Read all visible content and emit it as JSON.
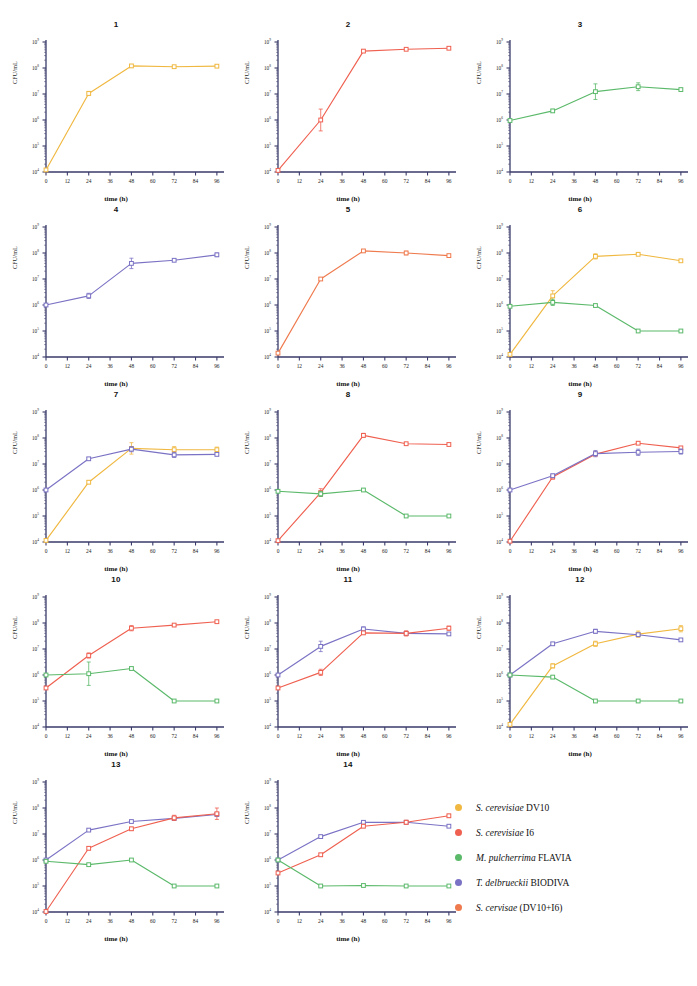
{
  "figure": {
    "axis": {
      "xlabel": "time (h)",
      "ylabel": "CFU/mL",
      "xticks": [
        0,
        12,
        24,
        36,
        48,
        60,
        72,
        84,
        96
      ],
      "ylog_exponents": [
        4,
        5,
        6,
        7,
        8,
        9
      ],
      "ytick_base": "10",
      "xlim": [
        0,
        100
      ],
      "ylim_exp": [
        4,
        9
      ],
      "grid": false
    },
    "caption": "",
    "legend": {
      "position": "bottom-right",
      "entries": [
        {
          "label_italic": "S. cerevisiae",
          "label_plain": "DV10",
          "color": "#f0b840",
          "key": "DV10"
        },
        {
          "label_italic": "S. cerevisiae",
          "label_plain": "I6",
          "color": "#ef6050",
          "key": "I6"
        },
        {
          "label_italic": "M. pulcherrima",
          "label_plain": "FLAVIA",
          "color": "#5bb96a",
          "key": "FLAVIA"
        },
        {
          "label_italic": "T. delbrueckii",
          "label_plain": "BIODIVA",
          "color": "#7a72c4",
          "key": "BIODIVA"
        },
        {
          "label_italic": "S. cervisae",
          "label_plain": "(DV10+I6)",
          "color": "#ef7a4e",
          "key": "DV10_I6"
        }
      ]
    }
  },
  "chart_data": [
    {
      "type": "line",
      "title": "1",
      "xlabel": "time (h)",
      "ylabel": "CFU/mL",
      "x": [
        0,
        24,
        48,
        72,
        96
      ],
      "xlim": [
        0,
        100
      ],
      "ylim": [
        4,
        9
      ],
      "yscale": "log10",
      "series": [
        {
          "name": "S. cerevisiae DV10",
          "color": "#f0b840",
          "log_values": [
            4.08,
            7.02,
            8.08,
            8.05,
            8.07
          ],
          "err_log": [
            0.05,
            0.08,
            0.05,
            0.02,
            0.02
          ]
        }
      ]
    },
    {
      "type": "line",
      "title": "2",
      "xlabel": "time (h)",
      "ylabel": "CFU/mL",
      "x": [
        0,
        24,
        48,
        72,
        96
      ],
      "xlim": [
        0,
        100
      ],
      "ylim": [
        4,
        9
      ],
      "yscale": "log10",
      "series": [
        {
          "name": "S. cerevisiae I6",
          "color": "#ef6050",
          "log_values": [
            4.06,
            6.0,
            8.65,
            8.72,
            8.76
          ],
          "err_log": [
            0.04,
            0.42,
            0.05,
            0.03,
            0.03
          ]
        }
      ]
    },
    {
      "type": "line",
      "title": "3",
      "xlabel": "time (h)",
      "ylabel": "CFU/mL",
      "x": [
        0,
        24,
        48,
        72,
        96
      ],
      "xlim": [
        0,
        100
      ],
      "ylim": [
        4,
        9
      ],
      "yscale": "log10",
      "series": [
        {
          "name": "M. pulcherrima FLAVIA",
          "color": "#5bb96a",
          "log_values": [
            5.98,
            6.35,
            7.09,
            7.28,
            7.17
          ],
          "err_log": [
            0.04,
            0.06,
            0.3,
            0.15,
            0.05
          ]
        }
      ]
    },
    {
      "type": "line",
      "title": "4",
      "xlabel": "time (h)",
      "ylabel": "CFU/mL",
      "x": [
        0,
        24,
        48,
        72,
        96
      ],
      "xlim": [
        0,
        100
      ],
      "ylim": [
        4,
        9
      ],
      "yscale": "log10",
      "series": [
        {
          "name": "T. delbrueckii BIODIVA",
          "color": "#7a72c4",
          "log_values": [
            6.0,
            6.35,
            7.6,
            7.72,
            7.93
          ],
          "err_log": [
            0.03,
            0.1,
            0.2,
            0.04,
            0.07
          ]
        }
      ]
    },
    {
      "type": "line",
      "title": "5",
      "xlabel": "time (h)",
      "ylabel": "CFU/mL",
      "x": [
        0,
        24,
        48,
        72,
        96
      ],
      "xlim": [
        0,
        100
      ],
      "ylim": [
        4,
        9
      ],
      "yscale": "log10",
      "series": [
        {
          "name": "S. cervisae (DV10+I6)",
          "color": "#ef7a4e",
          "log_values": [
            4.15,
            7.0,
            8.08,
            8.0,
            7.9
          ],
          "err_log": [
            0.04,
            0.05,
            0.04,
            0.07,
            0.04
          ]
        }
      ]
    },
    {
      "type": "line",
      "title": "6",
      "xlabel": "time (h)",
      "ylabel": "CFU/mL",
      "x": [
        0,
        24,
        48,
        72,
        96
      ],
      "xlim": [
        0,
        100
      ],
      "ylim": [
        4,
        9
      ],
      "yscale": "log10",
      "series": [
        {
          "name": "S. cerevisiae DV10",
          "color": "#f0b840",
          "log_values": [
            4.1,
            6.35,
            7.87,
            7.95,
            7.7
          ],
          "err_log": [
            0.05,
            0.2,
            0.1,
            0.03,
            0.03
          ]
        },
        {
          "name": "M. pulcherrima FLAVIA",
          "color": "#5bb96a",
          "log_values": [
            5.95,
            6.1,
            5.98,
            5.0,
            5.0
          ],
          "err_log": [
            0.04,
            0.12,
            0.04,
            0.02,
            0.02
          ]
        }
      ]
    },
    {
      "type": "line",
      "title": "7",
      "xlabel": "time (h)",
      "ylabel": "CFU/mL",
      "x": [
        0,
        24,
        48,
        72,
        96
      ],
      "xlim": [
        0,
        100
      ],
      "ylim": [
        4,
        9
      ],
      "yscale": "log10",
      "series": [
        {
          "name": "S. cerevisiae DV10",
          "color": "#f0b840",
          "log_values": [
            4.06,
            6.3,
            7.6,
            7.55,
            7.55
          ],
          "err_log": [
            0.04,
            0.06,
            0.22,
            0.12,
            0.1
          ]
        },
        {
          "name": "T. delbrueckii BIODIVA",
          "color": "#7a72c4",
          "log_values": [
            6.0,
            7.2,
            7.57,
            7.35,
            7.37
          ],
          "err_log": [
            0.03,
            0.05,
            0.1,
            0.1,
            0.05
          ]
        }
      ]
    },
    {
      "type": "line",
      "title": "8",
      "xlabel": "time (h)",
      "ylabel": "CFU/mL",
      "x": [
        0,
        24,
        48,
        72,
        96
      ],
      "xlim": [
        0,
        100
      ],
      "ylim": [
        4,
        9
      ],
      "yscale": "log10",
      "series": [
        {
          "name": "S. cerevisiae I6",
          "color": "#ef6050",
          "log_values": [
            4.05,
            5.9,
            8.1,
            7.78,
            7.75
          ],
          "err_log": [
            0.03,
            0.15,
            0.08,
            0.03,
            0.03
          ]
        },
        {
          "name": "M. pulcherrima FLAVIA",
          "color": "#5bb96a",
          "log_values": [
            5.95,
            5.85,
            6.0,
            5.0,
            5.0
          ],
          "err_log": [
            0.04,
            0.1,
            0.05,
            0.02,
            0.02
          ]
        }
      ]
    },
    {
      "type": "line",
      "title": "9",
      "xlabel": "time (h)",
      "ylabel": "CFU/mL",
      "x": [
        0,
        24,
        48,
        72,
        96
      ],
      "xlim": [
        0,
        100
      ],
      "ylim": [
        4,
        9
      ],
      "yscale": "log10",
      "series": [
        {
          "name": "S. cerevisiae I6",
          "color": "#ef6050",
          "log_values": [
            4.03,
            6.5,
            7.38,
            7.8,
            7.62
          ],
          "err_log": [
            0.03,
            0.08,
            0.05,
            0.05,
            0.05
          ]
        },
        {
          "name": "T. delbrueckii BIODIVA",
          "color": "#7a72c4",
          "log_values": [
            6.0,
            6.55,
            7.4,
            7.45,
            7.48
          ],
          "err_log": [
            0.03,
            0.06,
            0.12,
            0.12,
            0.1
          ]
        }
      ]
    },
    {
      "type": "line",
      "title": "10",
      "xlabel": "time (h)",
      "ylabel": "CFU/mL",
      "x": [
        0,
        24,
        48,
        72,
        96
      ],
      "xlim": [
        0,
        100
      ],
      "ylim": [
        4,
        9
      ],
      "yscale": "log10",
      "series": [
        {
          "name": "S. cerevisiae I6",
          "color": "#ef6050",
          "log_values": [
            5.5,
            6.75,
            7.8,
            7.92,
            8.05
          ],
          "err_log": [
            0.03,
            0.1,
            0.1,
            0.04,
            0.04
          ]
        },
        {
          "name": "M. pulcherrima FLAVIA",
          "color": "#5bb96a",
          "log_values": [
            6.0,
            6.05,
            6.25,
            5.0,
            5.0
          ],
          "err_log": [
            0.04,
            0.45,
            0.05,
            0.02,
            0.02
          ]
        }
      ]
    },
    {
      "type": "line",
      "title": "11",
      "xlabel": "time (h)",
      "ylabel": "CFU/mL",
      "x": [
        0,
        24,
        48,
        72,
        96
      ],
      "xlim": [
        0,
        100
      ],
      "ylim": [
        4,
        9
      ],
      "yscale": "log10",
      "series": [
        {
          "name": "T. delbrueckii BIODIVA",
          "color": "#7a72c4",
          "log_values": [
            6.0,
            7.1,
            7.77,
            7.6,
            7.58
          ],
          "err_log": [
            0.03,
            0.2,
            0.08,
            0.08,
            0.05
          ]
        },
        {
          "name": "S. cerevisiae I6",
          "color": "#ef6050",
          "log_values": [
            5.5,
            6.1,
            7.62,
            7.6,
            7.8
          ],
          "err_log": [
            0.03,
            0.12,
            0.05,
            0.1,
            0.08
          ]
        }
      ]
    },
    {
      "type": "line",
      "title": "12",
      "xlabel": "time (h)",
      "ylabel": "CFU/mL",
      "x": [
        0,
        24,
        48,
        72,
        96
      ],
      "xlim": [
        0,
        100
      ],
      "ylim": [
        4,
        9
      ],
      "yscale": "log10",
      "series": [
        {
          "name": "S. cerevisiae DV10",
          "color": "#f0b840",
          "log_values": [
            4.1,
            6.35,
            7.2,
            7.57,
            7.78
          ],
          "err_log": [
            0.04,
            0.08,
            0.1,
            0.12,
            0.12
          ]
        },
        {
          "name": "T. delbrueckii BIODIVA",
          "color": "#7a72c4",
          "log_values": [
            6.0,
            7.2,
            7.68,
            7.55,
            7.35
          ],
          "err_log": [
            0.03,
            0.05,
            0.08,
            0.05,
            0.05
          ]
        },
        {
          "name": "M. pulcherrima FLAVIA",
          "color": "#5bb96a",
          "log_values": [
            6.0,
            5.92,
            5.0,
            5.0,
            5.0
          ],
          "err_log": [
            0.04,
            0.06,
            0.02,
            0.02,
            0.02
          ]
        }
      ]
    },
    {
      "type": "line",
      "title": "13",
      "xlabel": "time (h)",
      "ylabel": "CFU/mL",
      "x": [
        0,
        24,
        48,
        72,
        96
      ],
      "xlim": [
        0,
        100
      ],
      "ylim": [
        4,
        9
      ],
      "yscale": "log10",
      "series": [
        {
          "name": "T. delbrueckii BIODIVA",
          "color": "#7a72c4",
          "log_values": [
            6.0,
            7.15,
            7.48,
            7.6,
            7.75
          ],
          "err_log": [
            0.03,
            0.04,
            0.04,
            0.08,
            0.06
          ]
        },
        {
          "name": "S. cerevisiae I6",
          "color": "#ef6050",
          "log_values": [
            4.02,
            6.45,
            7.2,
            7.62,
            7.78
          ],
          "err_log": [
            0.03,
            0.06,
            0.06,
            0.1,
            0.22
          ]
        },
        {
          "name": "M. pulcherrima FLAVIA",
          "color": "#5bb96a",
          "log_values": [
            5.95,
            5.82,
            6.0,
            5.0,
            5.0
          ],
          "err_log": [
            0.04,
            0.05,
            0.04,
            0.02,
            0.02
          ]
        }
      ]
    },
    {
      "type": "line",
      "title": "14",
      "xlabel": "time (h)",
      "ylabel": "CFU/mL",
      "x": [
        0,
        24,
        48,
        72,
        96
      ],
      "xlim": [
        0,
        100
      ],
      "ylim": [
        4,
        9
      ],
      "yscale": "log10",
      "series": [
        {
          "name": "T. delbrueckii BIODIVA",
          "color": "#7a72c4",
          "log_values": [
            6.0,
            6.9,
            7.45,
            7.45,
            7.3
          ],
          "err_log": [
            0.03,
            0.05,
            0.06,
            0.05,
            0.05
          ]
        },
        {
          "name": "S. cerevisiae I6",
          "color": "#ef6050",
          "log_values": [
            5.5,
            6.2,
            7.3,
            7.45,
            7.7
          ],
          "err_log": [
            0.03,
            0.06,
            0.06,
            0.08,
            0.06
          ]
        },
        {
          "name": "M. pulcherrima FLAVIA",
          "color": "#5bb96a",
          "log_values": [
            6.0,
            5.0,
            5.02,
            5.0,
            5.0
          ],
          "err_log": [
            0.04,
            0.03,
            0.02,
            0.02,
            0.02
          ]
        }
      ]
    }
  ]
}
